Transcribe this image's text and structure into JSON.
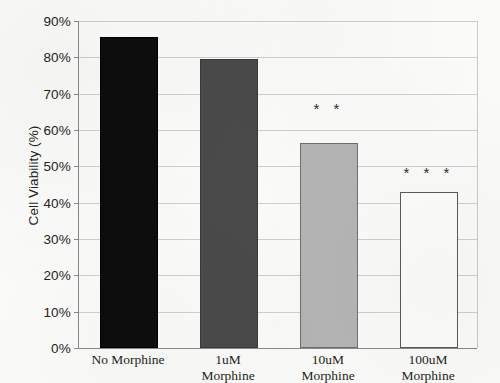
{
  "chart_data": {
    "type": "bar",
    "title": "",
    "xlabel": "",
    "ylabel": "Cell Viability (%)",
    "categories": [
      "No Morphine",
      "1uM Morphine",
      "10uM Morphine",
      "100uM Morphine"
    ],
    "values": [
      85.5,
      79.5,
      56.5,
      43.0
    ],
    "ylim": [
      0,
      90
    ],
    "ytick_values": [
      0,
      10,
      20,
      30,
      40,
      50,
      60,
      70,
      80,
      90
    ],
    "ytick_labels": [
      "0%",
      "10%",
      "20%",
      "30%",
      "40%",
      "50%",
      "60%",
      "70%",
      "80%",
      "90%"
    ],
    "grid": "horizontal",
    "legend": "none",
    "bars": [
      {
        "category_line1": "No Morphine",
        "category_line2": "",
        "value": 85.5,
        "fill": "#0d0d0d",
        "stroke": "#000000",
        "style": "solid-black",
        "annotation": ""
      },
      {
        "category_line1": "1uM",
        "category_line2": "Morphine",
        "value": 79.5,
        "fill": "#4a4a4a",
        "stroke": "#3a3a3a",
        "style": "dark-gray",
        "annotation": ""
      },
      {
        "category_line1": "10uM",
        "category_line2": "Morphine",
        "value": 56.5,
        "fill": "#b5b5b5",
        "stroke": "#6f6f6f",
        "style": "light-gray",
        "annotation": "* *"
      },
      {
        "category_line1": "100uM",
        "category_line2": "Morphine",
        "value": 43.0,
        "fill": "#fdfdfb",
        "stroke": "#5a5a5a",
        "style": "white-outline",
        "annotation": "* * *"
      }
    ],
    "annotations": [
      {
        "text": "* *",
        "category": "10uM Morphine",
        "at_value": 68.0
      },
      {
        "text": "* * *",
        "category": "100uM Morphine",
        "at_value": 50.5
      }
    ],
    "colors": {
      "gridline": "#cfcfcf",
      "axis": "#8a8a8a",
      "text": "#231f20",
      "background": "#fbfbf9"
    }
  }
}
